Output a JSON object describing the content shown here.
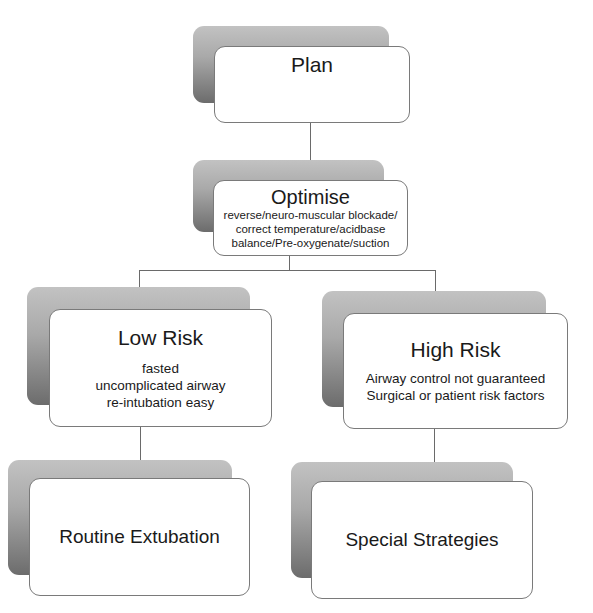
{
  "diagram": {
    "type": "flowchart",
    "nodes": {
      "plan": {
        "title": "Plan"
      },
      "optimise": {
        "title": "Optimise",
        "lines": [
          "reverse/neuro-muscular blockade/",
          "correct temperature/acidbase",
          "balance/Pre-oxygenate/suction"
        ]
      },
      "low_risk": {
        "title": "Low Risk",
        "lines": [
          "fasted",
          "uncomplicated airway",
          "re-intubation easy"
        ]
      },
      "high_risk": {
        "title": "High Risk",
        "lines": [
          "Airway control not guaranteed",
          "Surgical or patient risk factors"
        ]
      },
      "routine": {
        "title": "Routine Extubation"
      },
      "special": {
        "title": "Special Strategies"
      }
    },
    "edges": [
      [
        "Plan",
        "Optimise"
      ],
      [
        "Optimise",
        "Low Risk"
      ],
      [
        "Optimise",
        "High Risk"
      ],
      [
        "Low Risk",
        "Routine Extubation"
      ],
      [
        "High Risk",
        "Special Strategies"
      ]
    ],
    "colors": {
      "background": "#ffffff",
      "node_fill": "#ffffff",
      "node_border": "#7a7a7a",
      "shadow_top": "#c2c2c2",
      "shadow_bottom": "#6c6c6c",
      "connector": "#6a6a6a"
    }
  }
}
